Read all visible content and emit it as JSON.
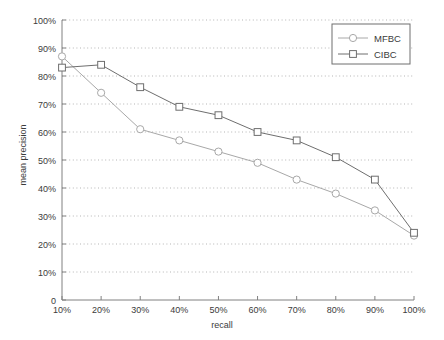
{
  "chart_data": {
    "type": "line",
    "title": "",
    "xlabel": "recall",
    "ylabel": "mean precision",
    "x": [
      10,
      20,
      30,
      40,
      50,
      60,
      70,
      80,
      90,
      100
    ],
    "xtick_labels": [
      "10%",
      "20%",
      "30%",
      "40%",
      "50%",
      "60%",
      "70%",
      "80%",
      "90%",
      "100%"
    ],
    "ytick_labels": [
      "0",
      "10%",
      "20%",
      "30%",
      "40%",
      "50%",
      "60%",
      "70%",
      "80%",
      "90%",
      "100%"
    ],
    "ytick_values": [
      0,
      10,
      20,
      30,
      40,
      50,
      60,
      70,
      80,
      90,
      100
    ],
    "xlim": [
      10,
      100
    ],
    "ylim": [
      0,
      100
    ],
    "grid": "horizontal-dotted",
    "legend_position": "upper-right-inside",
    "series": [
      {
        "name": "MFBC",
        "marker": "circle",
        "color": "#a8a8a8",
        "values": [
          87,
          74,
          61,
          57,
          53,
          49,
          43,
          38,
          32,
          23
        ]
      },
      {
        "name": "CIBC",
        "marker": "square",
        "color": "#6e6e6e",
        "values": [
          83,
          84,
          76,
          69,
          66,
          60,
          57,
          51,
          43,
          24
        ]
      }
    ]
  },
  "legend": {
    "entries": [
      {
        "label": "MFBC"
      },
      {
        "label": "CIBC"
      }
    ]
  },
  "colors": {
    "axis": "#808080",
    "grid": "#b5b5b5",
    "text": "#3b3b3b",
    "background": "#ffffff",
    "series_mfbc": "#a8a8a8",
    "series_cibc": "#6e6e6e"
  }
}
